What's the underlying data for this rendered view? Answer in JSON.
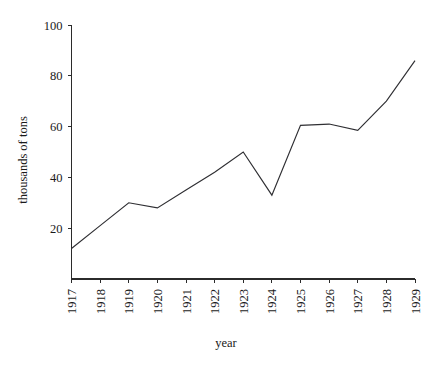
{
  "chart_data": {
    "type": "line",
    "title": "",
    "subtitle": "",
    "xlabel": "year",
    "ylabel": "thousands of tons",
    "categories": [
      "1917",
      "1918",
      "1919",
      "1920",
      "1921",
      "1922",
      "1923",
      "1924",
      "1925",
      "1926",
      "1927",
      "1928",
      "1929"
    ],
    "x": [
      1917,
      1918,
      1919,
      1920,
      1921,
      1922,
      1923,
      1924,
      1925,
      1926,
      1927,
      1928,
      1929
    ],
    "values": [
      12,
      21,
      30,
      28,
      35,
      42,
      50,
      33,
      60.5,
      61,
      58.5,
      70,
      86
    ],
    "series": [
      {
        "name": "tonnage",
        "values": [
          12,
          21,
          30,
          28,
          35,
          42,
          50,
          33,
          60.5,
          61,
          58.5,
          70,
          86
        ]
      }
    ],
    "ylim": [
      0,
      100
    ],
    "xlim": [
      1917,
      1929
    ],
    "yticks": [
      20,
      40,
      60,
      80,
      100
    ],
    "ytick_labels": [
      "20",
      "40",
      "60",
      "80",
      "100"
    ],
    "xtick_labels": [
      "1917",
      "1918",
      "1919",
      "1920",
      "1921",
      "1922",
      "1923",
      "1924",
      "1925",
      "1926",
      "1927",
      "1928",
      "1929"
    ],
    "grid": false,
    "legend": false,
    "legend_position": "none",
    "line_color": "#2f2f33",
    "axis_color": "#2b2b2b",
    "background_color": "#ffffff"
  }
}
